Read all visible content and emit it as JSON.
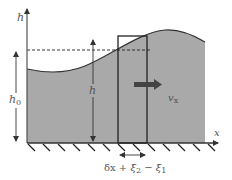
{
  "diagram": {
    "labels": {
      "vertical_axis": "h",
      "horizontal_axis": "x",
      "undisturbed_depth_base": "h",
      "undisturbed_depth_sub": "0",
      "local_height": "h",
      "velocity_base": "v",
      "velocity_sub": "x",
      "width_expression_delta": "δx",
      "width_expression_rest_1": " + ξ",
      "width_expression_sub_1": "2",
      "width_expression_rest_2": " − ξ",
      "width_expression_sub_2": "1"
    },
    "colors": {
      "fluid_fill": "#a9a9a9",
      "lines": "#333333",
      "velocity_arrow": "#444444",
      "text": "#555555"
    }
  }
}
